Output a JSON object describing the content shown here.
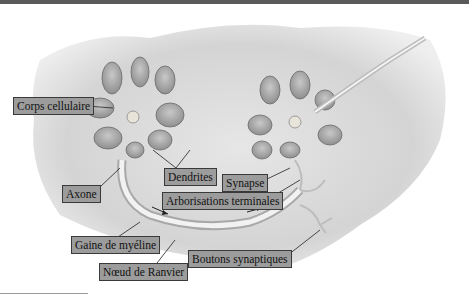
{
  "diagram": {
    "type": "neuron anatomy illustration",
    "colors": {
      "label_bg": "#9c9c9c",
      "label_border": "#3a3a3a",
      "topbar": "#5a5a5a"
    },
    "labels": [
      {
        "id": "corps-cellulaire",
        "text": "Corps cellulaire"
      },
      {
        "id": "dendrites",
        "text": "Dendrites"
      },
      {
        "id": "synapse",
        "text": "Synapse"
      },
      {
        "id": "arborisations",
        "text": "Arborisations terminales"
      },
      {
        "id": "axone",
        "text": "Axone"
      },
      {
        "id": "gaine",
        "text": "Gaine de myéline"
      },
      {
        "id": "noeud",
        "text": "Nœud de Ranvier"
      },
      {
        "id": "boutons",
        "text": "Boutons synaptiques"
      }
    ]
  }
}
